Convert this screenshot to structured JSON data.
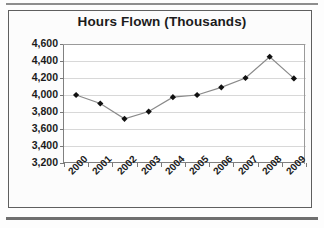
{
  "chart_data": {
    "type": "line",
    "title": "Hours Flown (Thousands)",
    "xlabel": "",
    "ylabel": "",
    "categories": [
      "2000",
      "2001",
      "2002",
      "2003",
      "2004",
      "2005",
      "2006",
      "2007",
      "2008",
      "2009"
    ],
    "values": [
      4000,
      3900,
      3720,
      3805,
      3975,
      4000,
      4090,
      4200,
      4450,
      4195
    ],
    "series": [
      {
        "name": "Hours Flown",
        "values": [
          4000,
          3900,
          3720,
          3805,
          3975,
          4000,
          4090,
          4200,
          4450,
          4195
        ]
      }
    ],
    "ylim": [
      3200,
      4600
    ],
    "ytick_values": [
      4600,
      4400,
      4200,
      4000,
      3800,
      3600,
      3400,
      3200
    ],
    "ytick_labels": [
      "4,600",
      "4,400",
      "4,200",
      "4,000",
      "3,800",
      "3,600",
      "3,400",
      "3,200"
    ],
    "grid": true,
    "grid_axis": "y",
    "legend": false,
    "marker": "diamond",
    "marker_color": "#111111",
    "line_color": "#8a8a8a",
    "plot_background": "#ffffff",
    "xtick_rotation": -45
  },
  "figure": {
    "background": "#fdfdfd",
    "border_color": "#5f5f5f",
    "rule_color": "#7f7f7f"
  }
}
